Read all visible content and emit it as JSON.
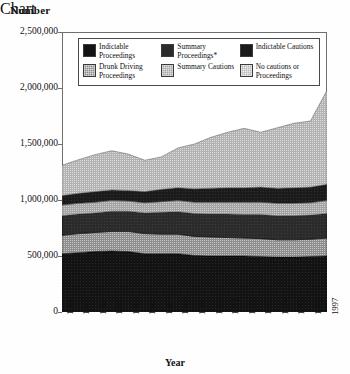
{
  "chart_data": {
    "type": "area",
    "stacked": true,
    "title": "",
    "ylabel": "Number",
    "xlabel": "Year",
    "ylim": [
      0,
      2500000
    ],
    "ytick_labels": [
      "0",
      "500,000",
      "1,000,000",
      "1,500,000",
      "2,000,000",
      "2,500,000"
    ],
    "ytick_values": [
      0,
      500000,
      1000000,
      1500000,
      2000000,
      2500000
    ],
    "grid": false,
    "legend_position": "inside-top",
    "categories": [
      1981,
      1982,
      1983,
      1984,
      1985,
      1986,
      1987,
      1988,
      1989,
      1990,
      1991,
      1992,
      1993,
      1994,
      1995,
      1996,
      1997
    ],
    "x": [
      "1981",
      "1982",
      "1983",
      "1984",
      "1985",
      "1986",
      "1987",
      "1988",
      "1989",
      "1990",
      "1991",
      "1992",
      "1993",
      "1994",
      "1995",
      "1996",
      "1997"
    ],
    "series": [
      {
        "name": "Indictable Proceedings",
        "color": "#131313",
        "values": [
          520000,
          530000,
          540000,
          545000,
          540000,
          520000,
          520000,
          520000,
          505000,
          500000,
          500000,
          500000,
          495000,
          490000,
          490000,
          495000,
          500000
        ]
      },
      {
        "name": "Drunk Driving Proceedings",
        "color": "#8e8e8e",
        "values": [
          165000,
          170000,
          170000,
          175000,
          180000,
          180000,
          175000,
          175000,
          170000,
          170000,
          165000,
          160000,
          160000,
          155000,
          155000,
          155000,
          160000
        ]
      },
      {
        "name": "Summary Proceedings*",
        "color": "#2b2b2b",
        "values": [
          175000,
          175000,
          175000,
          180000,
          180000,
          185000,
          195000,
          200000,
          205000,
          205000,
          210000,
          210000,
          215000,
          215000,
          215000,
          215000,
          220000
        ]
      },
      {
        "name": "Summary Cautions",
        "color": "#a9a9a9",
        "values": [
          95000,
          95000,
          95000,
          95000,
          90000,
          90000,
          95000,
          100000,
          100000,
          105000,
          105000,
          110000,
          110000,
          110000,
          110000,
          110000,
          115000
        ]
      },
      {
        "name": "Indictable Cautions",
        "color": "#1b1b1b",
        "values": [
          85000,
          90000,
          95000,
          95000,
          95000,
          100000,
          110000,
          115000,
          120000,
          125000,
          130000,
          130000,
          135000,
          135000,
          140000,
          140000,
          145000
        ]
      },
      {
        "name": "No cautions or Proceedings",
        "color": "#b7b7b7",
        "values": [
          270000,
          300000,
          330000,
          350000,
          325000,
          280000,
          290000,
          355000,
          400000,
          455000,
          495000,
          530000,
          490000,
          540000,
          575000,
          590000,
          840000
        ]
      }
    ],
    "series_totals": [
      1310000,
      1360000,
      1405000,
      1440000,
      1410000,
      1355000,
      1385000,
      1465000,
      1500000,
      1560000,
      1605000,
      1640000,
      1605000,
      1645000,
      1685000,
      1705000,
      1980000
    ]
  },
  "legend": {
    "items": [
      {
        "label": "Indictable Proceedings",
        "swatch": "f0"
      },
      {
        "label": "Summary Proceedings*",
        "swatch": "f2"
      },
      {
        "label": "Indictable Cautions",
        "swatch": "f4"
      },
      {
        "label": "Drunk Driving Proceedings",
        "swatch": "f1"
      },
      {
        "label": "Summary Cautions",
        "swatch": "f3"
      },
      {
        "label": "No cautions or Proceedings",
        "swatch": "f5"
      }
    ]
  },
  "axes": {
    "y_title": "Number",
    "x_title": "Year"
  }
}
